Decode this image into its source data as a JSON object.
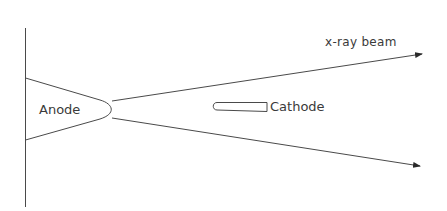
{
  "diagram": {
    "type": "x-ray tube schematic",
    "labels": {
      "anode": "Anode",
      "cathode": "Cathode",
      "beam": "x-ray beam"
    },
    "colors": {
      "stroke": "#4a4a4a",
      "text": "#3a3a3a",
      "background": "#ffffff"
    },
    "elements": [
      {
        "id": "wall",
        "kind": "vertical-line"
      },
      {
        "id": "anode",
        "kind": "wedge-with-rounded-tip"
      },
      {
        "id": "cathode",
        "kind": "tapered-filament"
      },
      {
        "id": "beam-upper",
        "kind": "arrow"
      },
      {
        "id": "beam-lower",
        "kind": "arrow"
      }
    ]
  }
}
